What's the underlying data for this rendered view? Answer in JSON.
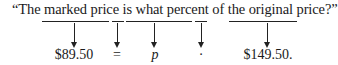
{
  "sentence": "“The marked price is what percent of the original price?”",
  "mapping": [
    {
      "phrase": "marked price",
      "term": "$89.50",
      "italic": false
    },
    {
      "phrase": "is",
      "term": "=",
      "italic": false
    },
    {
      "phrase": "what percent",
      "term": "p",
      "italic": true
    },
    {
      "phrase": "of",
      "term": "·",
      "italic": false
    },
    {
      "phrase": "original price",
      "term": "$149.50.",
      "italic": false
    }
  ]
}
